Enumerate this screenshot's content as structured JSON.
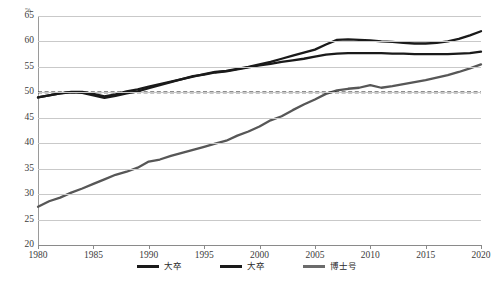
{
  "chart_data": {
    "type": "line",
    "title": "",
    "xlabel": "",
    "ylabel": "%",
    "ylim": [
      20,
      65
    ],
    "xlim": [
      1980,
      2020
    ],
    "grid": true,
    "legend_position": "bottom",
    "yticks": [
      65,
      60,
      55,
      50,
      45,
      40,
      35,
      30,
      25,
      20
    ],
    "xticks": [
      1980,
      1985,
      1990,
      1995,
      2000,
      2005,
      2010,
      2015,
      2020
    ],
    "x": [
      1980,
      1981,
      1982,
      1983,
      1984,
      1985,
      1986,
      1987,
      1988,
      1989,
      1990,
      1991,
      1992,
      1993,
      1994,
      1995,
      1996,
      1997,
      1998,
      1999,
      2000,
      2001,
      2002,
      2003,
      2004,
      2005,
      2006,
      2007,
      2008,
      2009,
      2010,
      2011,
      2012,
      2013,
      2014,
      2015,
      2016,
      2017,
      2018,
      2019,
      2020
    ],
    "series": [
      {
        "name": "大卒",
        "color": "#1a1a1a",
        "style": "solid",
        "values": [
          49.0,
          49.4,
          49.8,
          50.1,
          50.1,
          49.7,
          49.2,
          49.6,
          50.2,
          50.6,
          51.1,
          51.6,
          52.1,
          52.6,
          53.1,
          53.6,
          54.0,
          54.2,
          54.6,
          55.0,
          55.5,
          56.0,
          56.6,
          57.2,
          57.8,
          58.4,
          59.4,
          60.3,
          60.4,
          60.3,
          60.2,
          60.0,
          59.9,
          59.7,
          59.6,
          59.6,
          59.7,
          60.0,
          60.5,
          61.2,
          62.0
        ]
      },
      {
        "name": "大卒",
        "color": "#1a1a1a",
        "style": "solid",
        "values": [
          49.0,
          49.4,
          49.8,
          50.0,
          49.9,
          49.4,
          48.9,
          49.3,
          49.8,
          50.2,
          50.8,
          51.4,
          52.0,
          52.6,
          53.2,
          53.5,
          53.9,
          54.1,
          54.5,
          54.9,
          55.3,
          55.6,
          56.0,
          56.3,
          56.6,
          57.0,
          57.4,
          57.6,
          57.7,
          57.7,
          57.7,
          57.7,
          57.6,
          57.6,
          57.5,
          57.5,
          57.5,
          57.5,
          57.6,
          57.7,
          58.0
        ]
      },
      {
        "name": "博士号",
        "color": "#575757",
        "style": "solid",
        "values": [
          27.5,
          28.6,
          29.3,
          30.3,
          31.1,
          32.0,
          32.9,
          33.8,
          34.4,
          35.2,
          36.4,
          36.8,
          37.5,
          38.1,
          38.7,
          39.3,
          39.9,
          40.5,
          41.5,
          42.3,
          43.3,
          44.5,
          45.3,
          46.5,
          47.6,
          48.6,
          49.7,
          50.4,
          50.7,
          50.9,
          51.4,
          50.9,
          51.2,
          51.6,
          52.0,
          52.4,
          52.9,
          53.4,
          54.0,
          54.7,
          55.5
        ]
      }
    ],
    "reference_line": {
      "name": "50-percent-reference",
      "value": 50,
      "style": "dashed",
      "color": "#1a1a1a"
    },
    "legend": [
      {
        "label": "大卒",
        "color": "#1a1a1a"
      },
      {
        "label": "大卒",
        "color": "#1a1a1a"
      },
      {
        "label": "博士号",
        "color": "#6b6b6b"
      }
    ]
  }
}
